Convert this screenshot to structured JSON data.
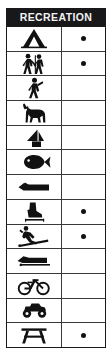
{
  "legend": {
    "title": "RECREATION",
    "colors": {
      "header_background": "#18181a",
      "header_text": "#f2f2f2",
      "border": "#1a1a1a",
      "grid_line": "#3a3a3a",
      "icon_fill": "#111111",
      "dot_fill": "#111111",
      "background": "#ffffff"
    },
    "columns": [
      {
        "key": "symbol",
        "header": ""
      },
      {
        "key": "available",
        "header": ""
      }
    ],
    "row_count": 12,
    "marked_row_count": 5,
    "rows": [
      {
        "icon": "tent-icon",
        "label": "Camping",
        "marked": true,
        "mark": "●"
      },
      {
        "icon": "hikers-icon",
        "label": "Hiking",
        "marked": true,
        "mark": "●"
      },
      {
        "icon": "walking-person-icon",
        "label": "Walking Trail",
        "marked": false,
        "mark": ""
      },
      {
        "icon": "horse-icon",
        "label": "Horseback Riding",
        "marked": false,
        "mark": ""
      },
      {
        "icon": "sailboat-icon",
        "label": "Sailing",
        "marked": false,
        "mark": ""
      },
      {
        "icon": "fish-icon",
        "label": "Fishing",
        "marked": false,
        "mark": ""
      },
      {
        "icon": "motorboat-icon",
        "label": "Boating",
        "marked": false,
        "mark": ""
      },
      {
        "icon": "ice-skate-icon",
        "label": "Ice Skating",
        "marked": true,
        "mark": "●"
      },
      {
        "icon": "downhill-skier-icon",
        "label": "Skiing",
        "marked": true,
        "mark": "●"
      },
      {
        "icon": "snowmobile-icon",
        "label": "Snowmobiling",
        "marked": false,
        "mark": ""
      },
      {
        "icon": "bicycle-icon",
        "label": "Bicycling",
        "marked": false,
        "mark": ""
      },
      {
        "icon": "off-road-vehicle-icon",
        "label": "Off-Road Vehicle",
        "marked": false,
        "mark": ""
      },
      {
        "icon": "picnic-table-icon",
        "label": "Picnic Area",
        "marked": true,
        "mark": "●"
      }
    ]
  }
}
